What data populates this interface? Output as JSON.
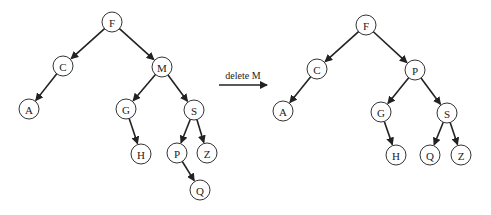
{
  "diagram": {
    "radius": 10,
    "colors": {
      "stroke": "#333333",
      "edge": "#222222",
      "background": "#ffffff"
    },
    "operation": {
      "label": "delete M",
      "x1": 219,
      "x2": 267,
      "y": 85,
      "label_x": 243,
      "label_y": 79
    },
    "trees": [
      {
        "name": "before",
        "nodes": [
          {
            "id": "F",
            "label": "F",
            "x": 112,
            "y": 22
          },
          {
            "id": "C",
            "label": "C",
            "x": 63,
            "y": 66
          },
          {
            "id": "M",
            "label": "M",
            "x": 162,
            "y": 67
          },
          {
            "id": "A",
            "label": "A",
            "x": 29,
            "y": 109
          },
          {
            "id": "G",
            "label": "G",
            "x": 126,
            "y": 109
          },
          {
            "id": "S",
            "label": "S",
            "x": 194,
            "y": 110
          },
          {
            "id": "H",
            "label": "H",
            "x": 141,
            "y": 154
          },
          {
            "id": "P",
            "label": "P",
            "x": 177,
            "y": 153
          },
          {
            "id": "Z",
            "label": "Z",
            "x": 207,
            "y": 153
          },
          {
            "id": "Q",
            "label": "Q",
            "x": 200,
            "y": 190
          }
        ],
        "edges": [
          [
            "F",
            "C"
          ],
          [
            "F",
            "M"
          ],
          [
            "C",
            "A"
          ],
          [
            "M",
            "G"
          ],
          [
            "M",
            "S"
          ],
          [
            "G",
            "H"
          ],
          [
            "S",
            "P"
          ],
          [
            "S",
            "Z"
          ],
          [
            "P",
            "Q"
          ]
        ]
      },
      {
        "name": "after",
        "nodes": [
          {
            "id": "F",
            "label": "F",
            "x": 366,
            "y": 25
          },
          {
            "id": "C",
            "label": "C",
            "x": 317,
            "y": 69
          },
          {
            "id": "P",
            "label": "P",
            "x": 415,
            "y": 70
          },
          {
            "id": "A",
            "label": "A",
            "x": 283,
            "y": 111
          },
          {
            "id": "G",
            "label": "G",
            "x": 381,
            "y": 112
          },
          {
            "id": "S",
            "label": "S",
            "x": 447,
            "y": 113
          },
          {
            "id": "H",
            "label": "H",
            "x": 396,
            "y": 155
          },
          {
            "id": "Q",
            "label": "Q",
            "x": 430,
            "y": 155
          },
          {
            "id": "Z",
            "label": "Z",
            "x": 461,
            "y": 155
          }
        ],
        "edges": [
          [
            "F",
            "C"
          ],
          [
            "F",
            "P"
          ],
          [
            "C",
            "A"
          ],
          [
            "P",
            "G"
          ],
          [
            "P",
            "S"
          ],
          [
            "G",
            "H"
          ],
          [
            "S",
            "Q"
          ],
          [
            "S",
            "Z"
          ]
        ]
      }
    ]
  }
}
